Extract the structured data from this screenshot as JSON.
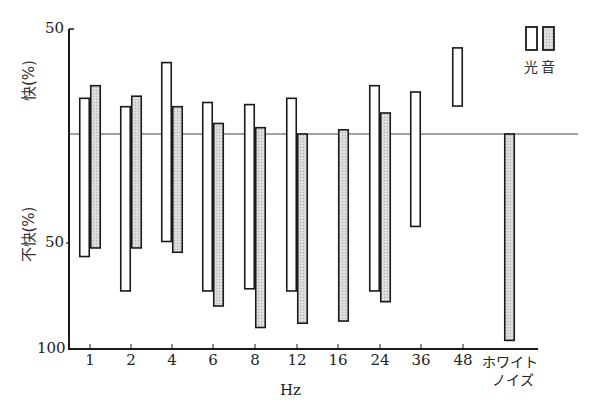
{
  "chart_data": {
    "type": "bar",
    "title": "",
    "xlabel": "Hz",
    "ylabel_upper": "快(%)",
    "ylabel_lower": "不快(%)",
    "y_ticks_upper": [
      "50"
    ],
    "y_ticks_lower": [
      "50",
      "100"
    ],
    "ylim_pleasant": [
      0,
      50
    ],
    "ylim_unpleasant": [
      0,
      100
    ],
    "categories": [
      "1",
      "2",
      "4",
      "6",
      "8",
      "12",
      "16",
      "24",
      "36",
      "48",
      "ホワイトノイズ"
    ],
    "category_labels_line2": [
      "",
      "",
      "",
      "",
      "",
      "",
      "",
      "",
      "",
      "",
      "ノイズ"
    ],
    "category_labels_line1": [
      "1",
      "2",
      "4",
      "6",
      "8",
      "12",
      "16",
      "24",
      "36",
      "48",
      "ホワイト"
    ],
    "legend": [
      {
        "name": "光",
        "style": "open"
      },
      {
        "name": "音",
        "style": "stippled"
      }
    ],
    "series": [
      {
        "name": "光",
        "pleasant": [
          17,
          13,
          34,
          15,
          14,
          17,
          null,
          23,
          20,
          41,
          null
        ],
        "unpleasant": [
          57,
          73,
          50,
          73,
          72,
          73,
          null,
          73,
          43,
          -13,
          null
        ]
      },
      {
        "name": "音",
        "pleasant": [
          23,
          18,
          13,
          5,
          3,
          0,
          2,
          10,
          null,
          null,
          0
        ],
        "unpleasant": [
          53,
          53,
          55,
          80,
          90,
          88,
          87,
          78,
          null,
          null,
          96
        ]
      }
    ],
    "grid": false,
    "legend_position": "top-right"
  },
  "colors": {
    "light_fill": "#ffffff",
    "sound_fill": "#d9d9d9",
    "stroke": "#1a1a1a"
  }
}
